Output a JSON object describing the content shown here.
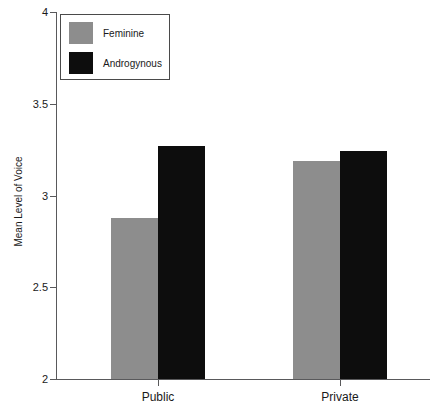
{
  "chart_data": {
    "type": "bar",
    "title": "",
    "xlabel": "",
    "ylabel": "Mean Level of Voice",
    "categories": [
      "Public",
      "Private"
    ],
    "series": [
      {
        "name": "Feminine",
        "color": "#8d8d8d",
        "values": [
          2.88,
          3.19
        ]
      },
      {
        "name": "Androgynous",
        "color": "#0d0d0d",
        "values": [
          3.27,
          3.24
        ]
      }
    ],
    "ylim": [
      2,
      4
    ],
    "yticks": [
      2,
      2.5,
      3,
      3.5,
      4
    ],
    "ytick_labels": [
      "2",
      "2.5",
      "3",
      "3.5",
      "4"
    ],
    "grid": false,
    "legend_position": "top-left"
  },
  "legend": {
    "entries": [
      {
        "label": "Feminine"
      },
      {
        "label": "Androgynous"
      }
    ]
  },
  "axes": {
    "y_title": "Mean Level of Voice"
  }
}
